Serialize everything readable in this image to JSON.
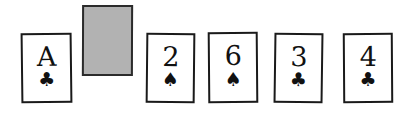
{
  "scene": {
    "background_color": "#ffffff",
    "ink_color": "#111111",
    "facedown_fill_color": "#b2b2b2"
  },
  "cards": [
    {
      "position": 1,
      "state": "face-up",
      "rank": "A",
      "suit_symbol": "♣",
      "suit_name": "clubs",
      "label": "Ace of Clubs",
      "icon": "club-suit-icon"
    },
    {
      "position": 2,
      "state": "face-down",
      "rank": "",
      "suit_symbol": "",
      "suit_name": "",
      "label": "Face-down card",
      "icon": "card-back-icon"
    },
    {
      "position": 3,
      "state": "face-up",
      "rank": "2",
      "suit_symbol": "♠",
      "suit_name": "spades",
      "label": "Two of Spades",
      "icon": "spade-suit-icon"
    },
    {
      "position": 4,
      "state": "face-up",
      "rank": "6",
      "suit_symbol": "♠",
      "suit_name": "spades",
      "label": "Six of Spades",
      "icon": "spade-suit-icon"
    },
    {
      "position": 5,
      "state": "face-up",
      "rank": "3",
      "suit_symbol": "♣",
      "suit_name": "clubs",
      "label": "Three of Clubs",
      "icon": "club-suit-icon"
    },
    {
      "position": 6,
      "state": "face-up",
      "rank": "4",
      "suit_symbol": "♣",
      "suit_name": "clubs",
      "label": "Four of Clubs",
      "icon": "club-suit-icon"
    }
  ]
}
